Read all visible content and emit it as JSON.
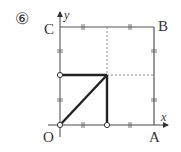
{
  "problem": {
    "number_label": "⑥"
  },
  "points": {
    "O": "O",
    "A": "A",
    "B": "B",
    "C": "C"
  },
  "axes": {
    "x_label": "x",
    "y_label": "y"
  },
  "colors": {
    "line": "#555555",
    "bold": "#222222",
    "dashed": "#888888"
  }
}
